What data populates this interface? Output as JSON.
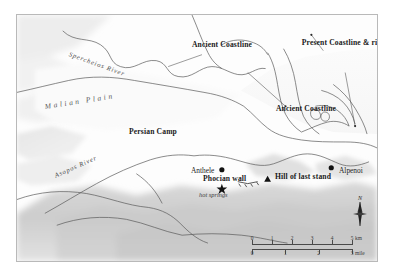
{
  "map": {
    "title": "Thermopylae battlefield map",
    "frame_color": "#b9b9b9",
    "background_color": "#fcfcfc",
    "labels": {
      "spercheios_river": "Spercheios River",
      "asopos_river": "Asopos River",
      "malian_plain": "Malian Plain",
      "persian_camp": "Persian Camp",
      "ancient_coastline_north": "Ancient Coastline",
      "ancient_coastline_east": "Ancient Coastline",
      "present_coastline": "Present Coastline & river",
      "anthele": "Anthele",
      "phocian_wall": "Phocian wall",
      "hot_springs": "hot springs",
      "hill_of_last_stand": "Hill of last stand",
      "alpenoi": "Alpenoi"
    },
    "scale": {
      "km_labels": [
        "0",
        "1",
        "2",
        "3",
        "4",
        "5"
      ],
      "km_unit": "km",
      "mile_labels": [
        "0",
        "1",
        "2",
        "3"
      ],
      "mile_unit": "mile"
    },
    "compass": {
      "north_label": "N"
    }
  }
}
